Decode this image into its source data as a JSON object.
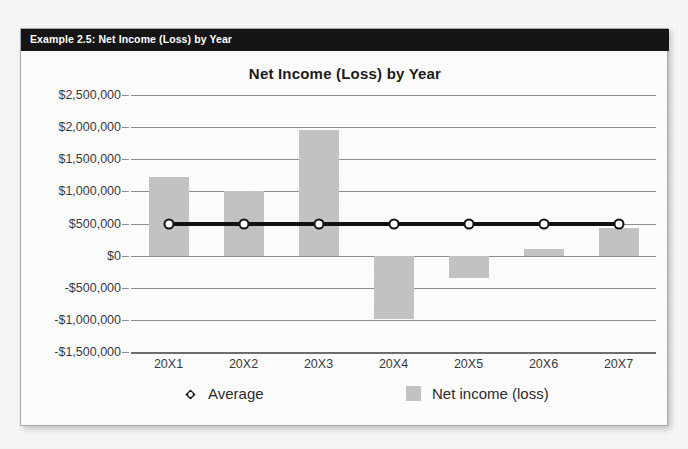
{
  "header": {
    "label": "Example 2.5: Net Income (Loss) by Year"
  },
  "colors": {
    "header_bar": "#151515",
    "bar_fill": "#c2c2c2",
    "average_line": "#111111",
    "gridline": "#8d8d8d",
    "card_background": "#fdfdfd"
  },
  "chart_data": {
    "type": "bar",
    "title": "Net Income (Loss) by Year",
    "xlabel": "",
    "ylabel": "",
    "categories": [
      "20X1",
      "20X2",
      "20X3",
      "20X4",
      "20X5",
      "20X6",
      "20X7"
    ],
    "series": [
      {
        "name": "Net income (loss)",
        "type": "bar",
        "values": [
          1230000,
          1000000,
          1950000,
          -980000,
          -350000,
          110000,
          430000
        ]
      },
      {
        "name": "Average",
        "type": "line",
        "values": [
          490000,
          490000,
          490000,
          490000,
          490000,
          490000,
          490000
        ]
      }
    ],
    "ylim": [
      -1500000,
      2500000
    ],
    "ytick_values": [
      2500000,
      2000000,
      1500000,
      1000000,
      500000,
      0,
      -500000,
      -1000000,
      -1500000
    ],
    "ytick_labels": [
      "$2,500,000",
      "$2,000,000",
      "$1,500,000",
      "$1,000,000",
      "$500,000",
      "$0",
      "-$500,000",
      "-$1,000,000",
      "-$1,500,000"
    ],
    "grid": true,
    "legend_position": "bottom",
    "legend": [
      {
        "label": "Average",
        "marker": "circle-on-line"
      },
      {
        "label": "Net income (loss)",
        "marker": "square"
      }
    ]
  }
}
